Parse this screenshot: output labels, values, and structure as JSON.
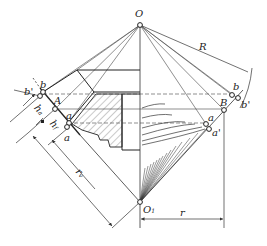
{
  "diagram": {
    "type": "bevel gear tooth profile construction (Tredgold approximation)",
    "colors": {
      "line": "#333333",
      "hatch": "#555555",
      "background": "#ffffff"
    },
    "labels": {
      "O": "O",
      "O1": "O",
      "O1_sub": "1",
      "R": "R",
      "r": "r",
      "B": "B",
      "A": "A",
      "b_right": "b",
      "b_prime_right": "b'",
      "a_right": "a",
      "a_prime_right": "a'",
      "b_left": "b",
      "b_prime_left": "b'",
      "a_left": "a",
      "a_left_lower": "a",
      "h_a": "h",
      "h_a_sub": "a",
      "h_f": "h",
      "h_f_sub": "f",
      "r_v": "r",
      "r_v_sub": "v"
    }
  }
}
